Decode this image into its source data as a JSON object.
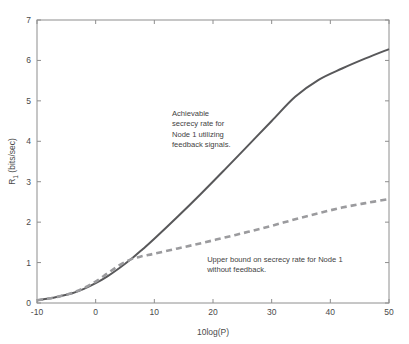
{
  "chart_data": {
    "type": "line",
    "title": "",
    "xlabel": "10log(P)",
    "ylabel": "R_1 (bits/sec)",
    "ylabel_base": "R",
    "ylabel_sub": "1",
    "ylabel_unit": " (bits/sec)",
    "xlim": [
      -10,
      50
    ],
    "ylim": [
      0,
      7
    ],
    "xticks": [
      -10,
      0,
      10,
      20,
      30,
      40,
      50
    ],
    "xtick_labels": [
      "-10",
      "0",
      "10",
      "20",
      "30",
      "40",
      "50"
    ],
    "yticks": [
      0,
      1,
      2,
      3,
      4,
      5,
      6,
      7
    ],
    "ytick_labels": [
      "0",
      "1",
      "2",
      "3",
      "4",
      "5",
      "6",
      "7"
    ],
    "grid": false,
    "legend_position": "none",
    "series": [
      {
        "name": "Achievable secrecy rate for Node 1 utilizing feedback signals",
        "style": "solid",
        "color": "#58585a",
        "width": 2.0,
        "x": [
          -10,
          -8,
          -6,
          -4,
          -2,
          0,
          2,
          4,
          6,
          8,
          10,
          14,
          18,
          22,
          26,
          30,
          34,
          38,
          42,
          46,
          50
        ],
        "y": [
          0.07,
          0.11,
          0.17,
          0.24,
          0.35,
          0.49,
          0.66,
          0.86,
          1.08,
          1.33,
          1.59,
          2.14,
          2.71,
          3.3,
          3.9,
          4.5,
          5.1,
          5.52,
          5.8,
          6.05,
          6.28
        ]
      },
      {
        "name": "Upper bound on secrecy rate for Node 1 without feedback",
        "style": "dashed",
        "color": "#9b9b9e",
        "width": 2.6,
        "dash": "6 4",
        "x": [
          -10,
          -8,
          -6,
          -4,
          -2,
          0,
          2,
          4,
          6,
          8,
          10,
          14,
          18,
          22,
          26,
          30,
          34,
          38,
          42,
          46,
          50
        ],
        "y": [
          0.07,
          0.11,
          0.17,
          0.25,
          0.37,
          0.53,
          0.73,
          0.93,
          1.08,
          1.16,
          1.22,
          1.35,
          1.48,
          1.62,
          1.76,
          1.91,
          2.07,
          2.22,
          2.36,
          2.47,
          2.57
        ]
      }
    ],
    "annotations": [
      {
        "name": "achievable-rate-annotation",
        "x_data": 13.0,
        "y_data": 4.62,
        "align": "start",
        "lines": [
          "Achievable",
          "secrecy rate for",
          "Node 1 utilizing",
          "feedback signals."
        ]
      },
      {
        "name": "upper-bound-annotation",
        "x_data": 19.0,
        "y_data": 1.02,
        "align": "start",
        "lines": [
          "Upper bound on secrecy rate for Node 1",
          "without feedback."
        ]
      }
    ],
    "colors": {
      "axis": "#8e8e8e",
      "text": "#4a4a4a",
      "background": "#ffffff",
      "solid_series": "#58585a",
      "dashed_series": "#9b9b9e"
    },
    "plot_box": {
      "left": 37,
      "top": 20,
      "right": 389,
      "bottom": 303
    }
  }
}
